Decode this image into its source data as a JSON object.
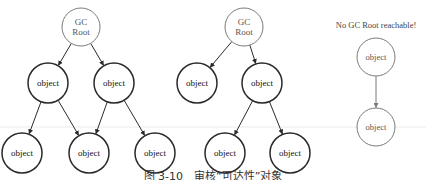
{
  "diagram": {
    "colors": {
      "stroke_dark": "#2a2a2a",
      "stroke_light": "#7a7a7a",
      "text": "#222222",
      "faint_line": "#e6e6e6"
    },
    "trees": [
      {
        "name": "left-tree",
        "nodes": [
          {
            "id": "a_root",
            "label_lines": [
              "GC",
              "Root"
            ],
            "x": 81,
            "y": 27,
            "r": 19,
            "style": "light"
          },
          {
            "id": "a_o1",
            "label": "object",
            "x": 48,
            "y": 83,
            "r": 20,
            "style": "dark"
          },
          {
            "id": "a_o2",
            "label": "object",
            "x": 114,
            "y": 83,
            "r": 20,
            "style": "dark"
          },
          {
            "id": "a_o3",
            "label": "object",
            "x": 22,
            "y": 153,
            "r": 20,
            "style": "dark"
          },
          {
            "id": "a_o4",
            "label": "object",
            "x": 89,
            "y": 153,
            "r": 20,
            "style": "dark"
          },
          {
            "id": "a_o5",
            "label": "object",
            "x": 155,
            "y": 153,
            "r": 20,
            "style": "dark"
          }
        ],
        "edges": [
          [
            "a_root",
            "a_o1"
          ],
          [
            "a_root",
            "a_o2"
          ],
          [
            "a_o1",
            "a_o3"
          ],
          [
            "a_o1",
            "a_o4"
          ],
          [
            "a_o2",
            "a_o4"
          ],
          [
            "a_o2",
            "a_o5"
          ]
        ]
      },
      {
        "name": "middle-tree",
        "nodes": [
          {
            "id": "b_root",
            "label_lines": [
              "GC",
              "Root"
            ],
            "x": 244,
            "y": 27,
            "r": 19,
            "style": "light"
          },
          {
            "id": "b_o1",
            "label": "object",
            "x": 197,
            "y": 83,
            "r": 20,
            "style": "dark"
          },
          {
            "id": "b_o2",
            "label": "object",
            "x": 262,
            "y": 83,
            "r": 20,
            "style": "dark"
          },
          {
            "id": "b_o3",
            "label": "object",
            "x": 225,
            "y": 153,
            "r": 20,
            "style": "dark"
          },
          {
            "id": "b_o4",
            "label": "object",
            "x": 290,
            "y": 153,
            "r": 20,
            "style": "dark"
          }
        ],
        "edges": [
          [
            "b_root",
            "b_o1"
          ],
          [
            "b_root",
            "b_o2"
          ],
          [
            "b_o2",
            "b_o3"
          ],
          [
            "b_o2",
            "b_o4"
          ]
        ]
      },
      {
        "name": "unreachable-group",
        "title": "No GC Root reachable!",
        "title_x": 376,
        "title_y": 28,
        "nodes": [
          {
            "id": "c_o1",
            "label": "object",
            "x": 376,
            "y": 57,
            "r": 19,
            "style": "light"
          },
          {
            "id": "c_o2",
            "label": "object",
            "x": 376,
            "y": 127,
            "r": 19,
            "style": "light"
          }
        ],
        "edges": [
          [
            "c_o1",
            "c_o2"
          ]
        ]
      }
    ]
  },
  "caption": "图 3-10　审核“可达性”对象"
}
